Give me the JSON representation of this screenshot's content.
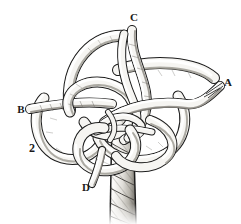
{
  "figure": {
    "number": "2",
    "kind": "rope-knot-line-drawing",
    "background_color": "#ffffff",
    "ink_color": "#1a1a1a",
    "rope_fill_color": "#f2f1ee",
    "shading_color": "#8d8b86",
    "labels": [
      {
        "id": "label-a",
        "text": "A",
        "x": 228,
        "y": 86,
        "role": "rope-end-right"
      },
      {
        "id": "label-b",
        "text": "B",
        "x": 21,
        "y": 113,
        "role": "rope-end-left"
      },
      {
        "id": "label-c",
        "text": "C",
        "x": 134,
        "y": 21,
        "role": "rope-end-top"
      },
      {
        "id": "label-d",
        "text": "D",
        "x": 86,
        "y": 191,
        "role": "rope-end-lower-left"
      }
    ],
    "figure_number_position": {
      "x": 32,
      "y": 152
    },
    "parts": [
      {
        "name": "standing-part",
        "description": "twisted three-strand rope running down from knot centre to bottom edge"
      },
      {
        "name": "top-loop",
        "description": "large bight arching over the top-left of the knot toward end C"
      },
      {
        "name": "left-loop",
        "description": "bight curving out to the left toward end B"
      },
      {
        "name": "right-loop",
        "description": "bight curving out to the right toward end A"
      },
      {
        "name": "lower-loop",
        "description": "bight curving down and left toward end D"
      },
      {
        "name": "centre-crossings",
        "description": "interwoven over-under crossings at the knot centre"
      }
    ]
  }
}
